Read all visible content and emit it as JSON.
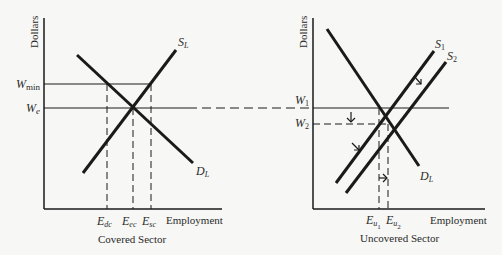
{
  "left_panel": {
    "caption": "Covered Sector",
    "y_axis_label": "Dollars",
    "x_axis_label": "Employment",
    "price_labels": {
      "w_min_base": "W",
      "w_min_sub": "min",
      "w_e_base": "W",
      "w_e_sub": "e"
    },
    "curves": {
      "supply": {
        "base": "S",
        "sub": "L"
      },
      "demand": {
        "base": "D",
        "sub": "L"
      }
    },
    "qty_labels": [
      {
        "base": "E",
        "sub": "dc"
      },
      {
        "base": "E",
        "sub": "ec"
      },
      {
        "base": "E",
        "sub": "sc"
      }
    ]
  },
  "right_panel": {
    "caption": "Uncovered Sector",
    "y_axis_label": "Dollars",
    "x_axis_label": "Employment",
    "price_labels": {
      "w1_base": "W",
      "w1_sub": "1",
      "w2_base": "W",
      "w2_sub": "2"
    },
    "curves": {
      "supply1": {
        "base": "S",
        "sub": "1"
      },
      "supply2": {
        "base": "S",
        "sub": "2"
      },
      "demand": {
        "base": "D",
        "sub": "L"
      }
    },
    "qty_labels": [
      {
        "base": "E",
        "sub": "u",
        "subsub": "1"
      },
      {
        "base": "E",
        "sub": "u",
        "subsub": "2"
      }
    ]
  },
  "colors": {
    "line": "#1a1a1a",
    "background": "#f7f7f5"
  }
}
